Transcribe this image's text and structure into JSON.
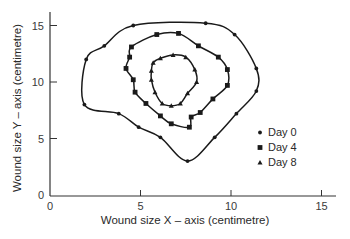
{
  "chart_data": {
    "type": "line",
    "title": "",
    "xlabel": "Wound size X – axis (centimetre)",
    "ylabel": "Wound size Y – axis (centimetre)",
    "xlim": [
      0,
      15.5
    ],
    "ylim": [
      0,
      16.5
    ],
    "xticks": [
      0,
      5,
      10,
      15
    ],
    "yticks": [
      0,
      5,
      10,
      15
    ],
    "grid": false,
    "legend_position": "lower right",
    "closed_curves": true,
    "series": [
      {
        "name": "Day 0",
        "marker": "circle",
        "points": [
          [
            2.0,
            12.0
          ],
          [
            3.0,
            13.2
          ],
          [
            4.6,
            15.0
          ],
          [
            8.6,
            15.2
          ],
          [
            10.2,
            14.2
          ],
          [
            11.4,
            11.2
          ],
          [
            11.4,
            9.2
          ],
          [
            10.3,
            7.2
          ],
          [
            9.1,
            5.1
          ],
          [
            7.6,
            3.0
          ],
          [
            6.1,
            5.1
          ],
          [
            4.9,
            6.0
          ],
          [
            3.8,
            7.2
          ],
          [
            1.9,
            8.0
          ]
        ]
      },
      {
        "name": "Day 4",
        "marker": "square",
        "points": [
          [
            4.5,
            13.1
          ],
          [
            5.9,
            14.2
          ],
          [
            7.1,
            14.3
          ],
          [
            8.2,
            13.2
          ],
          [
            9.3,
            12.2
          ],
          [
            9.8,
            11.1
          ],
          [
            9.8,
            9.7
          ],
          [
            9.0,
            8.5
          ],
          [
            8.3,
            7.3
          ],
          [
            7.8,
            6.9
          ],
          [
            7.7,
            6.0
          ],
          [
            6.7,
            6.3
          ],
          [
            6.1,
            7.0
          ],
          [
            5.3,
            8.1
          ],
          [
            4.7,
            9.1
          ],
          [
            4.6,
            10.2
          ],
          [
            4.2,
            11.2
          ],
          [
            4.4,
            12.2
          ]
        ]
      },
      {
        "name": "Day 8",
        "marker": "triangle",
        "points": [
          [
            6.1,
            12.1
          ],
          [
            6.8,
            12.4
          ],
          [
            7.5,
            12.2
          ],
          [
            8.0,
            11.1
          ],
          [
            8.1,
            10.0
          ],
          [
            7.6,
            9.0
          ],
          [
            7.2,
            8.1
          ],
          [
            6.7,
            7.9
          ],
          [
            6.2,
            8.1
          ],
          [
            5.8,
            9.1
          ],
          [
            5.6,
            10.2
          ],
          [
            5.6,
            11.0
          ],
          [
            5.7,
            11.7
          ]
        ]
      }
    ]
  },
  "legend": {
    "items": [
      {
        "label": "Day 0",
        "marker": "circle"
      },
      {
        "label": "Day 4",
        "marker": "square"
      },
      {
        "label": "Day 8",
        "marker": "triangle"
      }
    ]
  },
  "axes": {
    "x_tick_labels": [
      "0",
      "5",
      "10",
      "15"
    ],
    "y_tick_labels": [
      "0",
      "5",
      "10",
      "15"
    ]
  },
  "colors": {
    "line": "#1a1a1a",
    "axis": "#333333"
  }
}
